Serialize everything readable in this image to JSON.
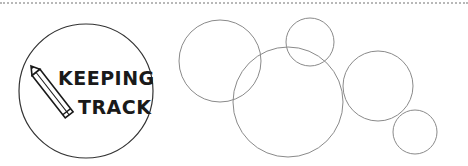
{
  "logo": {
    "line1": "KEEPING",
    "line2": "TRACK",
    "icon": "pencil-icon",
    "circle": {
      "cx": 86,
      "cy": 91,
      "r": 67,
      "stroke": "#333333"
    }
  },
  "decorative_circles": [
    {
      "cx": 220,
      "cy": 61,
      "r": 41
    },
    {
      "cx": 310,
      "cy": 42,
      "r": 24
    },
    {
      "cx": 288,
      "cy": 102,
      "r": 55
    },
    {
      "cx": 378,
      "cy": 86,
      "r": 35
    },
    {
      "cx": 415,
      "cy": 132,
      "r": 22
    }
  ],
  "colors": {
    "background": "#ffffff",
    "circle_stroke": "#8a8a8a",
    "dotted_rule": "#b8b8b8",
    "ink": "#1a1a1a"
  }
}
